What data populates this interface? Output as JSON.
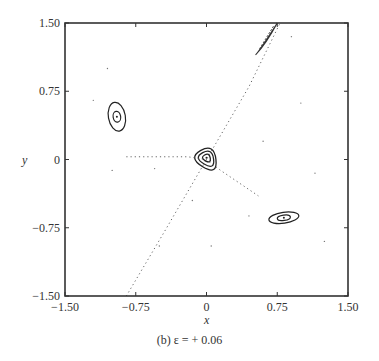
{
  "chart_data": {
    "type": "scatter",
    "title": "",
    "caption": "(b)  ε = + 0.06",
    "xlabel": "x",
    "ylabel": "y",
    "xlim": [
      -1.5,
      1.5
    ],
    "ylim": [
      -1.5,
      1.5
    ],
    "xticks": [
      -1.5,
      -0.75,
      0,
      0.75,
      1.5
    ],
    "yticks": [
      -1.5,
      -0.75,
      0,
      0.75,
      1.5
    ],
    "xtick_labels": [
      "−1.50",
      "−0.75",
      "0",
      "0.75",
      "1.50"
    ],
    "ytick_labels": [
      "−1.50",
      "−0.75",
      "0",
      "0.75",
      "1.50"
    ],
    "grid": false,
    "legend": null,
    "series": [
      {
        "name": "central triangular orbits",
        "kind": "closed-curves",
        "center": [
          0.0,
          0.02
        ],
        "curves": [
          [
            [
              -0.2,
              0.02
            ],
            [
              0.08,
              0.18
            ],
            [
              0.12,
              -0.18
            ]
          ],
          [
            [
              -0.14,
              0.02
            ],
            [
              0.06,
              0.13
            ],
            [
              0.09,
              -0.12
            ]
          ],
          [
            [
              -0.07,
              0.02
            ],
            [
              0.03,
              0.08
            ],
            [
              0.05,
              -0.05
            ]
          ]
        ]
      },
      {
        "name": "upper-left island",
        "kind": "closed-curves",
        "center": [
          -0.95,
          0.47
        ],
        "rx": [
          0.09,
          0.04
        ],
        "ry": [
          0.16,
          0.06
        ]
      },
      {
        "name": "lower-right island",
        "kind": "closed-curves",
        "center": [
          0.82,
          -0.64
        ],
        "rx": [
          0.16,
          0.07
        ],
        "ry": [
          0.06,
          0.03
        ]
      },
      {
        "name": "upper-right streak",
        "kind": "closed-curves",
        "center": [
          0.62,
          1.27
        ],
        "points": [
          [
            0.52,
            1.15
          ],
          [
            0.75,
            1.5
          ]
        ]
      },
      {
        "name": "diagonal separatrix",
        "kind": "dotted-line",
        "points": [
          [
            -0.85,
            -1.5
          ],
          [
            -0.45,
            -0.8
          ],
          [
            0.0,
            0.0
          ],
          [
            0.45,
            0.8
          ],
          [
            0.78,
            1.5
          ]
        ]
      },
      {
        "name": "horizontal separatrix",
        "kind": "dotted-line",
        "points": [
          [
            -0.85,
            0.03
          ],
          [
            -0.2,
            0.03
          ],
          [
            0.0,
            0.0
          ],
          [
            0.15,
            -0.12
          ],
          [
            0.55,
            -0.4
          ]
        ]
      }
    ],
    "scattered_points": [
      [
        -1.05,
        1.0
      ],
      [
        -1.2,
        0.65
      ],
      [
        -1.0,
        -0.12
      ],
      [
        -0.55,
        -0.1
      ],
      [
        -0.5,
        -0.95
      ],
      [
        0.05,
        -0.95
      ],
      [
        0.45,
        -0.62
      ],
      [
        0.6,
        0.2
      ],
      [
        1.0,
        0.62
      ],
      [
        1.25,
        -0.9
      ],
      [
        1.15,
        -0.15
      ],
      [
        0.9,
        1.35
      ],
      [
        -0.15,
        -0.45
      ]
    ]
  }
}
